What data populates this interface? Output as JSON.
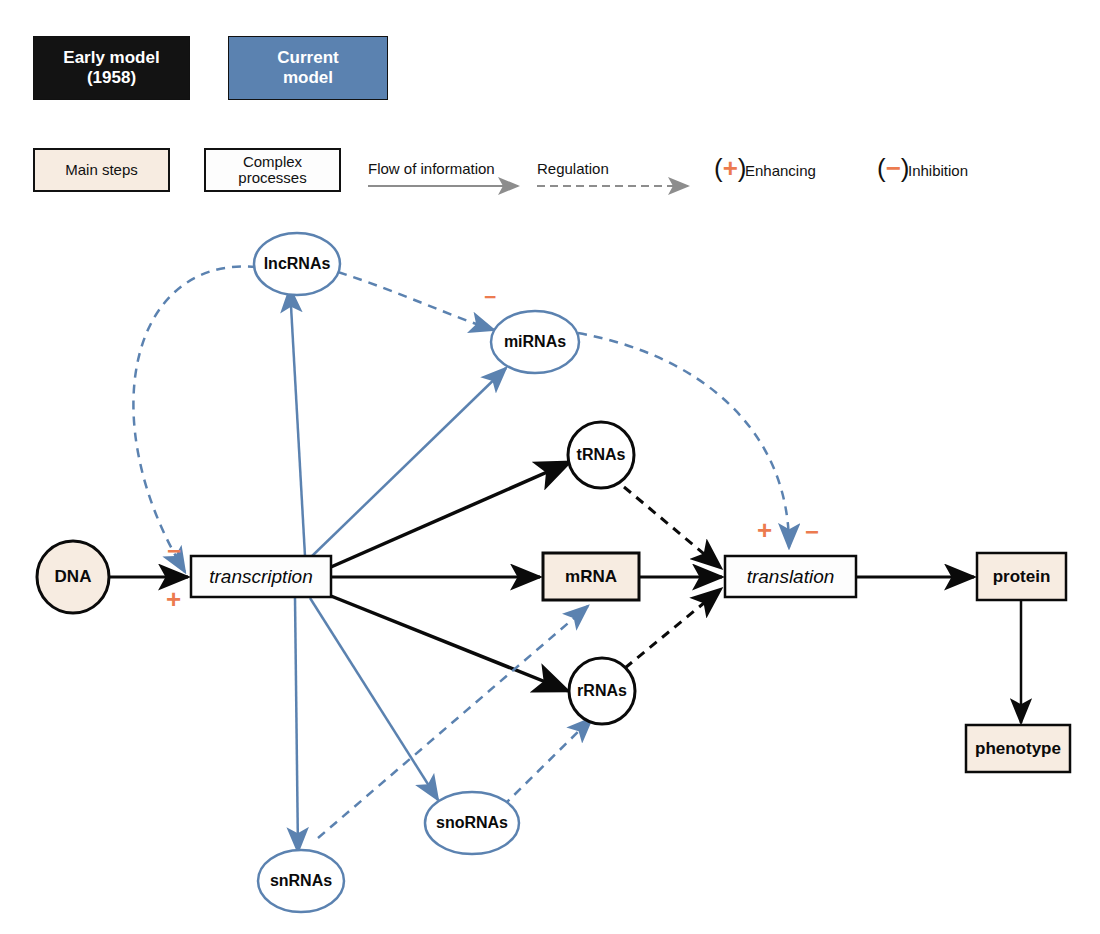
{
  "models": {
    "early": {
      "label": "Early model\n(1958)",
      "color": "#131313"
    },
    "current": {
      "label": "Current\nmodel",
      "color": "#5b82b0"
    }
  },
  "legend": {
    "main_steps": {
      "label": "Main steps",
      "fill": "#f7ece1"
    },
    "complex_processes": {
      "label": "Complex\nprocesses",
      "fill": "#fdfdfd"
    },
    "flow_of_information": "Flow of information",
    "regulation": "Regulation",
    "enhancing": {
      "label": "Enhancing",
      "sign": "+",
      "open": "(",
      "close": ")"
    },
    "inhibition": {
      "label": "Inhibition",
      "sign": "−",
      "open": "(",
      "close": ")"
    },
    "colors": {
      "orange": "#ec7b4f",
      "blue": "#5b82b0",
      "black": "#0a0a0a",
      "arrow_gray": "#8d8d8d"
    }
  },
  "nodes": {
    "dna": {
      "label": "DNA",
      "shape": "circle",
      "style": "early",
      "fill": "#f7ece1"
    },
    "transcription": {
      "label": "transcription",
      "shape": "box",
      "style": "early",
      "fill": "#fdfdfd"
    },
    "mrna": {
      "label": "mRNA",
      "shape": "box",
      "style": "early",
      "fill": "#f7ece1"
    },
    "translation": {
      "label": "translation",
      "shape": "box",
      "style": "early",
      "fill": "#fdfdfd"
    },
    "protein": {
      "label": "protein",
      "shape": "box",
      "style": "early",
      "fill": "#f7ece1"
    },
    "phenotype": {
      "label": "phenotype",
      "shape": "box",
      "style": "early",
      "fill": "#f7ece1"
    },
    "trnas": {
      "label": "tRNAs",
      "shape": "circle",
      "style": "early",
      "fill": "#ffffff"
    },
    "rrnas": {
      "label": "rRNAs",
      "shape": "circle",
      "style": "early",
      "fill": "#ffffff"
    },
    "lncrnas": {
      "label": "lncRNAs",
      "shape": "ellipse",
      "style": "current",
      "fill": "#ffffff"
    },
    "mirnas": {
      "label": "miRNAs",
      "shape": "ellipse",
      "style": "current",
      "fill": "#ffffff"
    },
    "snrnas": {
      "label": "snRNAs",
      "shape": "ellipse",
      "style": "current",
      "fill": "#ffffff"
    },
    "snornas": {
      "label": "snoRNAs",
      "shape": "ellipse",
      "style": "current",
      "fill": "#ffffff"
    }
  },
  "edge_signs": {
    "transcription_inhibit": "−",
    "transcription_enhance": "+",
    "mirna_inhibit": "−",
    "translation_enhance": "+",
    "translation_inhibit": "−"
  },
  "edges": [
    {
      "from": "dna",
      "to": "transcription",
      "kind": "flow",
      "style": "early"
    },
    {
      "from": "transcription",
      "to": "mrna",
      "kind": "flow",
      "style": "early"
    },
    {
      "from": "transcription",
      "to": "trnas",
      "kind": "flow",
      "style": "early"
    },
    {
      "from": "transcription",
      "to": "rrnas",
      "kind": "flow",
      "style": "early"
    },
    {
      "from": "mrna",
      "to": "translation",
      "kind": "flow",
      "style": "early"
    },
    {
      "from": "trnas",
      "to": "translation",
      "kind": "regulation",
      "style": "early"
    },
    {
      "from": "rrnas",
      "to": "translation",
      "kind": "regulation",
      "style": "early"
    },
    {
      "from": "translation",
      "to": "protein",
      "kind": "flow",
      "style": "early"
    },
    {
      "from": "protein",
      "to": "phenotype",
      "kind": "flow",
      "style": "early"
    },
    {
      "from": "transcription",
      "to": "lncrnas",
      "kind": "flow",
      "style": "current"
    },
    {
      "from": "transcription",
      "to": "mirnas",
      "kind": "flow",
      "style": "current"
    },
    {
      "from": "transcription",
      "to": "snrnas",
      "kind": "flow",
      "style": "current"
    },
    {
      "from": "transcription",
      "to": "snornas",
      "kind": "flow",
      "style": "current"
    },
    {
      "from": "lncrnas",
      "to": "transcription",
      "kind": "regulation",
      "style": "current"
    },
    {
      "from": "lncrnas",
      "to": "mirnas",
      "kind": "regulation",
      "style": "current"
    },
    {
      "from": "mirnas",
      "to": "translation",
      "kind": "regulation",
      "style": "current"
    },
    {
      "from": "snrnas",
      "to": "mrna",
      "kind": "regulation",
      "style": "current"
    },
    {
      "from": "snornas",
      "to": "rrnas",
      "kind": "regulation",
      "style": "current"
    }
  ]
}
